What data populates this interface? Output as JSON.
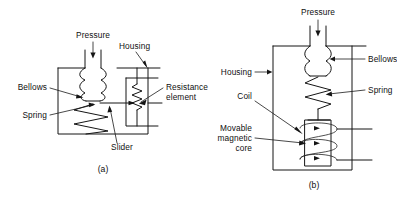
{
  "figure": {
    "type": "technical-line-diagram",
    "background_color": "#ffffff",
    "line_color": "#151515",
    "width": 397,
    "height": 198
  },
  "diagram_a": {
    "caption": "(a)",
    "labels": {
      "pressure": "Pressure",
      "housing": "Housing",
      "bellows": "Bellows",
      "spring": "Spring",
      "slider": "Slider",
      "resistance_element_line1": "Resistance",
      "resistance_element_line2": "element"
    }
  },
  "diagram_b": {
    "caption": "(b)",
    "labels": {
      "pressure": "Pressure",
      "housing": "Housing",
      "bellows": "Bellows",
      "spring": "Spring",
      "coil": "Coil",
      "core_line1": "Movable",
      "core_line2": "magnetic",
      "core_line3": "core"
    }
  }
}
